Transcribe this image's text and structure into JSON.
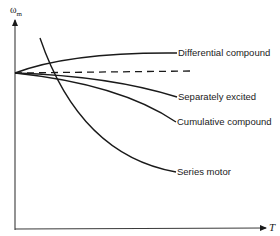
{
  "axes": {
    "y_label": "ω",
    "y_label_sub": "m",
    "x_label": "T"
  },
  "curves": [
    {
      "id": "differential",
      "label": "Differential compound",
      "style": "solid"
    },
    {
      "id": "no-load-reference",
      "label": "",
      "style": "dashed"
    },
    {
      "id": "separately",
      "label": "Separately excited",
      "style": "solid"
    },
    {
      "id": "cumulative",
      "label": "Cumulative compound",
      "style": "solid"
    },
    {
      "id": "series",
      "label": "Series motor",
      "style": "solid"
    }
  ],
  "colors": {
    "line": "#1a1a1a",
    "background": "#ffffff"
  }
}
